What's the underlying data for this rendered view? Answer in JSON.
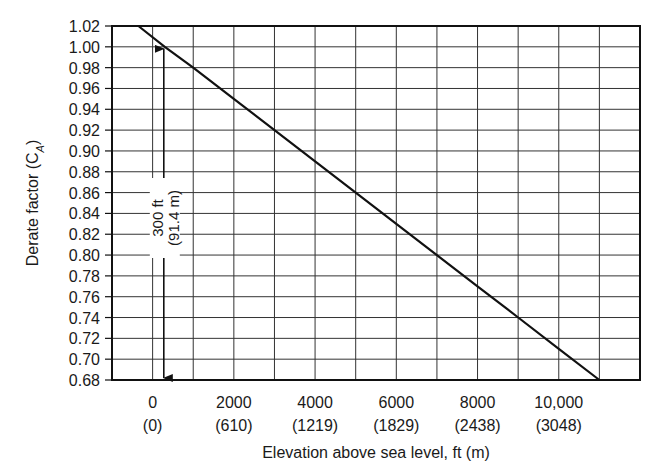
{
  "chart_data": {
    "type": "line",
    "title": "",
    "xlabel": "Elevation above sea level, ft (m)",
    "ylabel": "Derate factor (C",
    "ylabel_subscript": "A",
    "ylabel_close": ")",
    "xlim": [
      -1000,
      12000
    ],
    "ylim": [
      0.68,
      1.02
    ],
    "grid": true,
    "x_grid_step": 1000,
    "y_grid_step": 0.02,
    "x_ticks": [
      {
        "value": 0,
        "label": "0",
        "sublabel": "(0)"
      },
      {
        "value": 2000,
        "label": "2000",
        "sublabel": "(610)"
      },
      {
        "value": 4000,
        "label": "4000",
        "sublabel": "(1219)"
      },
      {
        "value": 6000,
        "label": "6000",
        "sublabel": "(1829)"
      },
      {
        "value": 8000,
        "label": "8000",
        "sublabel": "(2438)"
      },
      {
        "value": 10000,
        "label": "10,000",
        "sublabel": "(3048)"
      }
    ],
    "y_ticks": [
      "1.02",
      "1.00",
      "0.98",
      "0.96",
      "0.94",
      "0.92",
      "0.90",
      "0.88",
      "0.86",
      "0.84",
      "0.82",
      "0.80",
      "0.78",
      "0.76",
      "0.74",
      "0.72",
      "0.70",
      "0.68"
    ],
    "series": [
      {
        "name": "Derate factor",
        "x": [
          -350,
          300,
          1000,
          2000,
          3000,
          4000,
          5000,
          6000,
          7000,
          8000,
          9000,
          10000,
          11000
        ],
        "y": [
          1.02,
          1.0,
          0.98,
          0.95,
          0.92,
          0.89,
          0.86,
          0.83,
          0.8,
          0.77,
          0.74,
          0.71,
          0.68
        ]
      }
    ],
    "annotations": [
      {
        "type": "double-arrow",
        "x": 300,
        "y_from": 0.68,
        "y_to": 1.0,
        "label_line1": "300 ft",
        "label_line2": "(91.4 m)"
      }
    ]
  }
}
